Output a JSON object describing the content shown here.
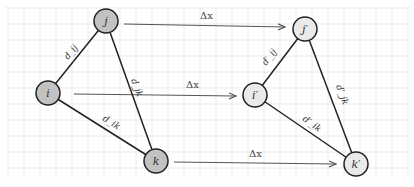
{
  "diagram": {
    "colors": {
      "left_node_fill": "#c2c2c2",
      "right_node_fill": "#eaeaea",
      "edge": "#222222",
      "arrow": "#555555",
      "grid": "#e6e6e6"
    },
    "nodes_left": [
      {
        "id": "j",
        "label": "j"
      },
      {
        "id": "i",
        "label": "i"
      },
      {
        "id": "k",
        "label": "k"
      }
    ],
    "nodes_right": [
      {
        "id": "j_prime",
        "label": "j′"
      },
      {
        "id": "i_prime",
        "label": "i′"
      },
      {
        "id": "k_prime",
        "label": "k′"
      }
    ],
    "edges_left": {
      "ij": "d_ij",
      "jk": "d_jk",
      "ik": "d_ik"
    },
    "edges_right": {
      "ij": "d′_ij",
      "jk": "d′_jk",
      "ik": "d′_ik"
    },
    "translations": [
      {
        "label": "Δx"
      },
      {
        "label": "Δx"
      },
      {
        "label": "Δx"
      }
    ]
  }
}
